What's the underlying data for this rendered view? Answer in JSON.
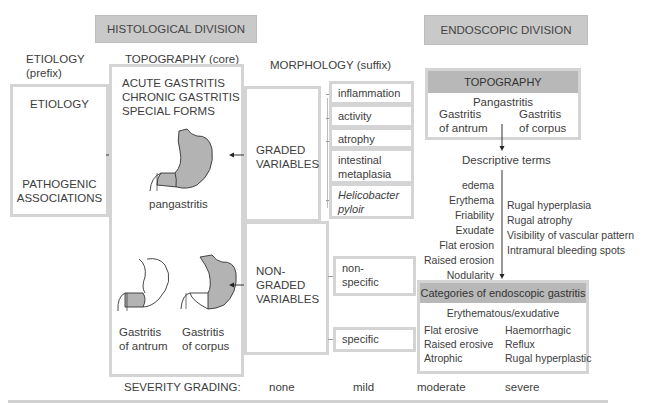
{
  "headers": {
    "histological": "HISTOLOGICAL DIVISION",
    "endoscopic": "ENDOSCOPIC DIVISION"
  },
  "columns": {
    "etiology": {
      "line1": "ETIOLOGY",
      "line2": "(prefix)"
    },
    "topography": "TOPOGRAPHY (core)",
    "morphology": "MORPHOLOGY (suffix)"
  },
  "etiology_box": {
    "title": "ETIOLOGY",
    "subtitle_line1": "PATHOGENIC",
    "subtitle_line2": "ASSOCIATIONS"
  },
  "topography_box": {
    "types": [
      "ACUTE GASTRITIS",
      "CHRONIC GASTRITIS",
      "SPECIAL FORMS"
    ],
    "pangastritis_label": "pangastritis",
    "antrum_label_line1": "Gastritis",
    "antrum_label_line2": "of antrum",
    "corpus_label_line1": "Gastritis",
    "corpus_label_line2": "of corpus"
  },
  "graded": {
    "label_line1": "GRADED",
    "label_line2": "VARIABLES",
    "items": [
      {
        "line1": "inflammation",
        "line2": ""
      },
      {
        "line1": "activity",
        "line2": ""
      },
      {
        "line1": "atrophy",
        "line2": ""
      },
      {
        "line1": "intestinal",
        "line2": "metaplasia"
      },
      {
        "line1": "Helicobacter",
        "line2": "pyloir"
      }
    ]
  },
  "non_graded": {
    "label_line1": "NON-",
    "label_line2": "GRADED",
    "label_line3": "VARIABLES",
    "items": [
      {
        "line1": "non-",
        "line2": "specific"
      },
      {
        "line1": "specific",
        "line2": ""
      }
    ]
  },
  "endoscopic_topography": {
    "title": "TOPOGRAPHY",
    "pangastritis": "Pangastritis",
    "antrum_line1": "Gastritis",
    "antrum_line2": "of antrum",
    "corpus_line1": "Gastritis",
    "corpus_line2": "of corpus"
  },
  "descriptive_terms": {
    "title": "Descriptive terms",
    "left": [
      "edema",
      "Erythema",
      "Friability",
      "Exudate",
      "Flat erosion",
      "Raised erosion",
      "Nodularity"
    ],
    "right": [
      "Rugal hyperplasia",
      "Rugal atrophy",
      "Visibility of vascular pattern",
      "Intramural bleeding spots"
    ]
  },
  "categories": {
    "title": "Categories of endoscopic gastritis",
    "first": "Erythematous/exudative",
    "left": [
      "Flat erosive",
      "Raised erosive",
      "Atrophic"
    ],
    "right": [
      "Haemorrhagic",
      "Reflux",
      "Rugal hyperplastic"
    ]
  },
  "severity": {
    "label": "SEVERITY GRADING:",
    "levels": [
      "none",
      "mild",
      "moderate",
      "severe"
    ]
  },
  "colors": {
    "header_fill": "#c9c9c9",
    "box_border": "#d4d4d4",
    "stomach_fill": "#b3b3b3",
    "text": "#3d3d3d"
  }
}
